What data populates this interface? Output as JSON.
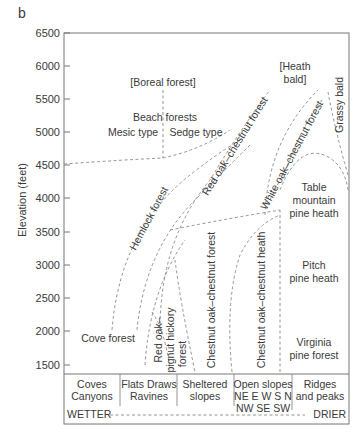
{
  "panel_label": "b",
  "y_axis": {
    "label": "Elevation (feet)",
    "ticks": [
      "6500",
      "6000",
      "5500",
      "5000",
      "4500",
      "4000",
      "3500",
      "3000",
      "2500",
      "2000",
      "1500"
    ]
  },
  "zones": {
    "boreal": "[Boreal forest]",
    "beach_title": "Beach forests",
    "mesic": "Mesic type",
    "sedge": "Sedge type",
    "heath_bald_1": "[Heath",
    "heath_bald_2": "bald]",
    "grassy_bald": "Grassy bald",
    "hemlock": "Hemlock forest",
    "red_oak_chestnut": "Red oak–chestnut forest",
    "white_oak_chestnut": "White oak–chestnut forest",
    "table_mountain_1": "Table",
    "table_mountain_2": "mountain",
    "table_mountain_3": "pine heath",
    "chestnut_oak_forest": "Chestnut oak–chestnut forest",
    "chestnut_oak_heath": "Chestnut oak–chestnut heath",
    "pitch_1": "Pitch",
    "pitch_2": "pine heath",
    "cove": "Cove forest",
    "red_oak_pignut_1": "Red oak–",
    "red_oak_pignut_2": "pignut hickory",
    "red_oak_pignut_3": "forest",
    "virginia_1": "Virginia",
    "virginia_2": "pine forest"
  },
  "topography": [
    {
      "line1": "Coves",
      "line2": "Canyons",
      "line3": ""
    },
    {
      "line1": "Flats Draws",
      "line2": "Ravines",
      "line3": ""
    },
    {
      "line1": "Sheltered",
      "line2": "slopes",
      "line3": ""
    },
    {
      "line1": "Open slopes",
      "line2": "NE E W S N",
      "line3": "NW SE SW"
    },
    {
      "line1": "Ridges",
      "line2": "and peaks",
      "line3": ""
    }
  ],
  "moisture": {
    "wet": "WETTER",
    "dry": "DRIER"
  }
}
